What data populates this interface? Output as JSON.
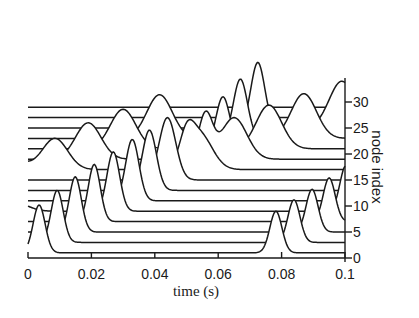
{
  "chart_data": {
    "type": "line",
    "subtype": "waterfall",
    "title": "",
    "xlabel": "time (s)",
    "ylabel": "node index",
    "xlim": [
      0,
      0.1
    ],
    "ylim": [
      0,
      33
    ],
    "x_ticks": [
      "0",
      "0.02",
      "0.04",
      "0.06",
      "0.08",
      "0.1"
    ],
    "x_tick_values": [
      0,
      0.02,
      0.04,
      0.06,
      0.08,
      0.1
    ],
    "y_ticks": [
      "0",
      "5",
      "10",
      "15",
      "20",
      "25",
      "30"
    ],
    "y_tick_values": [
      0,
      5,
      10,
      15,
      20,
      25,
      30
    ],
    "grid": false,
    "legend": null,
    "series": [
      {
        "name": "node 1",
        "baseline": 1,
        "pulses": [
          {
            "t": 0.0035,
            "amp": 9.2,
            "width": 0.0019
          },
          {
            "t": 0.0782,
            "amp": 8.0,
            "width": 0.0019
          }
        ]
      },
      {
        "name": "node 3",
        "baseline": 3,
        "pulses": [
          {
            "t": 0.0092,
            "amp": 10.0,
            "width": 0.0019
          },
          {
            "t": 0.0839,
            "amp": 8.2,
            "width": 0.0019
          }
        ]
      },
      {
        "name": "node 5",
        "baseline": 5,
        "pulses": [
          {
            "t": 0.0149,
            "amp": 10.6,
            "width": 0.0019
          },
          {
            "t": 0.0896,
            "amp": 8.2,
            "width": 0.0019
          }
        ]
      },
      {
        "name": "node 7",
        "baseline": 7,
        "pulses": [
          {
            "t": 0.0209,
            "amp": 11.0,
            "width": 0.0019
          },
          {
            "t": 0.095,
            "amp": 8.4,
            "width": 0.0019
          }
        ]
      },
      {
        "name": "node 9",
        "baseline": 9,
        "pulses": [
          {
            "t": 0.0269,
            "amp": 11.4,
            "width": 0.002
          },
          {
            "t": 0.1003,
            "amp": 8.8,
            "width": 0.0019
          },
          {
            "t": -0.004,
            "amp": 1.6,
            "width": 0.004
          }
        ]
      },
      {
        "name": "node 11",
        "baseline": 11,
        "pulses": [
          {
            "t": 0.0329,
            "amp": 11.8,
            "width": 0.0021
          }
        ]
      },
      {
        "name": "node 13",
        "baseline": 13,
        "pulses": [
          {
            "t": 0.0383,
            "amp": 11.6,
            "width": 0.0022
          }
        ]
      },
      {
        "name": "node 15",
        "baseline": 15,
        "pulses": [
          {
            "t": 0.044,
            "amp": 12.0,
            "width": 0.0026
          }
        ]
      },
      {
        "name": "node 17",
        "baseline": 17,
        "pulses": [
          {
            "t": 0.0085,
            "amp": 6.0,
            "width": 0.004
          },
          {
            "t": 0.05,
            "amp": 4.8,
            "width": 0.0022
          },
          {
            "t": 0.054,
            "amp": 7.0,
            "width": 0.004
          },
          {
            "t": -0.004,
            "amp": 1.6,
            "width": 0.004
          }
        ]
      },
      {
        "name": "node 19",
        "baseline": 19,
        "pulses": [
          {
            "t": 0.019,
            "amp": 7.0,
            "width": 0.004
          },
          {
            "t": 0.056,
            "amp": 8.6,
            "width": 0.0022
          },
          {
            "t": 0.065,
            "amp": 8.0,
            "width": 0.004
          }
        ]
      },
      {
        "name": "node 21",
        "baseline": 21,
        "pulses": [
          {
            "t": 0.03,
            "amp": 7.6,
            "width": 0.004
          },
          {
            "t": 0.0615,
            "amp": 10.0,
            "width": 0.0022
          },
          {
            "t": 0.076,
            "amp": 8.4,
            "width": 0.004
          }
        ]
      },
      {
        "name": "node 23",
        "baseline": 23,
        "pulses": [
          {
            "t": 0.0415,
            "amp": 8.4,
            "width": 0.004
          },
          {
            "t": 0.067,
            "amp": 11.4,
            "width": 0.0022
          },
          {
            "t": 0.087,
            "amp": 8.6,
            "width": 0.004
          }
        ]
      },
      {
        "name": "node 25",
        "baseline": 25,
        "pulses": [
          {
            "t": 0.0725,
            "amp": 12.6,
            "width": 0.0022
          },
          {
            "t": 0.099,
            "amp": 9.0,
            "width": 0.004
          }
        ]
      },
      {
        "name": "node 27",
        "baseline": 27,
        "pulses": []
      },
      {
        "name": "node 29",
        "baseline": 29,
        "pulses": []
      }
    ]
  },
  "axes": {
    "xlabel": "time (s)",
    "ylabel": "node index"
  }
}
